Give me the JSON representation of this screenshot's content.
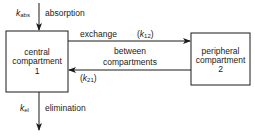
{
  "diagram": {
    "central_box": {
      "line1": "central",
      "line2": "compartment",
      "line3": "1"
    },
    "peripheral_box": {
      "line1": "peripheral",
      "line2": "compartment",
      "line3": "2"
    },
    "absorption": {
      "symbol": "k",
      "subscript": "abs",
      "label": "absorption"
    },
    "elimination": {
      "symbol": "k",
      "subscript": "el",
      "label": "elimination"
    },
    "exchange": {
      "label_line1": "exchange",
      "label_line2": "between",
      "label_line3": "compartments",
      "k12": {
        "open": "(",
        "symbol": "k",
        "subscript": "12",
        "close": ")"
      },
      "k21": {
        "open": "(",
        "symbol": "k",
        "subscript": "21",
        "close": ")"
      }
    },
    "stroke_color": "#1a1a1a"
  }
}
